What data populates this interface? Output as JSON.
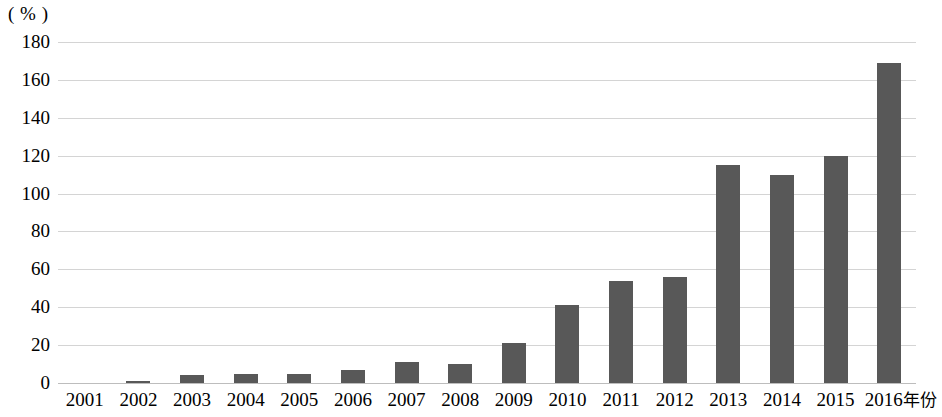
{
  "chart_data": {
    "type": "bar",
    "title": "",
    "subtitle": "",
    "xlabel": "年份",
    "ylabel": "",
    "unit_label": "( % )",
    "categories": [
      "2001",
      "2002",
      "2003",
      "2004",
      "2005",
      "2006",
      "2007",
      "2008",
      "2009",
      "2010",
      "2011",
      "2012",
      "2013",
      "2014",
      "2015",
      "2016"
    ],
    "values": [
      0,
      1,
      4,
      5,
      5,
      7,
      11,
      10,
      21,
      41,
      54,
      56,
      115,
      110,
      120,
      169
    ],
    "series": [
      {
        "name": "",
        "values": [
          0,
          1,
          4,
          5,
          5,
          7,
          11,
          10,
          21,
          41,
          54,
          56,
          115,
          110,
          120,
          169
        ]
      }
    ],
    "ylim": [
      0,
      180
    ],
    "yticks": [
      0,
      20,
      40,
      60,
      80,
      100,
      120,
      140,
      160,
      180
    ],
    "ytick_labels": [
      "0",
      "20",
      "40",
      "60",
      "80",
      "100",
      "120",
      "140",
      "160",
      "180"
    ],
    "grid": true,
    "legend": false,
    "legend_position": "none",
    "bar_color": "#585858",
    "gridline_color": "#d4d4d4",
    "background_color": "#ffffff",
    "x_axis_suffix_label": "年份"
  }
}
